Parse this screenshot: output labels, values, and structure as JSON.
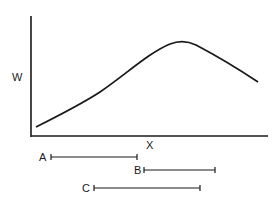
{
  "axes": {
    "y_label": "W",
    "x_label": "X"
  },
  "curve": {
    "description": "hump-shaped curve rising from lower-left, peaking right of center, then declining"
  },
  "intervals": [
    {
      "label": "A",
      "start": 51,
      "end": 137,
      "y": 157
    },
    {
      "label": "B",
      "start": 144,
      "end": 215,
      "y": 170
    },
    {
      "label": "C",
      "start": 94,
      "end": 200,
      "y": 188
    }
  ],
  "colors": {
    "ink": "#1a1a1a",
    "background": "#ffffff"
  }
}
